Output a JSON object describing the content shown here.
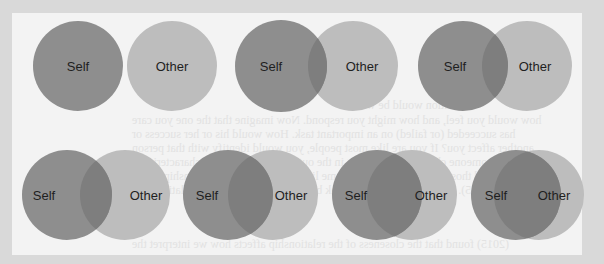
{
  "figure": {
    "type": "Inclusion of Other in the Self diagram",
    "labels": {
      "self": "Self",
      "other": "Other"
    },
    "colors": {
      "page_border": "#d9d9d9",
      "panel_background": "#f3f3f3",
      "self_fill": "#8e8e8e",
      "other_fill": "#bdbdbd",
      "overlap_fill": "#7e7e7e",
      "label_color": "#1f1f1f"
    },
    "pairs": [
      {
        "id": 1,
        "row": 1,
        "self": {
          "cx": 78,
          "cy": 66,
          "r": 45
        },
        "other": {
          "cx": 172,
          "cy": 66,
          "r": 45
        },
        "self_label": "Self",
        "other_label": "Other"
      },
      {
        "id": 2,
        "row": 1,
        "self": {
          "cx": 281,
          "cy": 66,
          "r": 46
        },
        "other": {
          "cx": 353,
          "cy": 66,
          "r": 45
        },
        "self_label": "Self",
        "other_label": "Other"
      },
      {
        "id": 3,
        "row": 1,
        "self": {
          "cx": 463,
          "cy": 66,
          "r": 45
        },
        "other": {
          "cx": 527,
          "cy": 66,
          "r": 45
        },
        "self_label": "Self",
        "other_label": "Other"
      },
      {
        "id": 4,
        "row": 2,
        "self": {
          "cx": 67,
          "cy": 195,
          "r": 45
        },
        "other": {
          "cx": 125,
          "cy": 195,
          "r": 45
        },
        "self_label": "Self",
        "other_label": "Other"
      },
      {
        "id": 5,
        "row": 2,
        "self": {
          "cx": 228,
          "cy": 195,
          "r": 45
        },
        "other": {
          "cx": 273,
          "cy": 195,
          "r": 45
        },
        "self_label": "Self",
        "other_label": "Other"
      },
      {
        "id": 6,
        "row": 2,
        "self": {
          "cx": 377,
          "cy": 195,
          "r": 45
        },
        "other": {
          "cx": 412,
          "cy": 195,
          "r": 45
        },
        "self_label": "Self",
        "other_label": "Other"
      },
      {
        "id": 7,
        "row": 2,
        "self": {
          "cx": 516,
          "cy": 195,
          "r": 45
        },
        "other": {
          "cx": 539,
          "cy": 195,
          "r": 45
        },
        "self_label": "Self",
        "other_label": "Other"
      }
    ],
    "label_positions": [
      {
        "self_x": 78,
        "other_x": 172
      },
      {
        "self_x": 271,
        "other_x": 362
      },
      {
        "self_x": 455,
        "other_x": 535
      },
      {
        "self_x": 44,
        "other_x": 146
      },
      {
        "self_x": 207,
        "other_x": 291
      },
      {
        "self_x": 356,
        "other_x": 431
      },
      {
        "self_x": 496,
        "other_x": 554
      }
    ]
  },
  "bleed_through": {
    "title_fragment": "W",
    "lines": [
      "cation would be what",
      "how would you feel, and how might you respond. Now imagine that the one you care",
      "has succeeded (or failed) on an important task. How would his or her success or",
      "another affect you? If you are like most people, you would identify with that person",
      "as someone close to you, sharing in the outcome, because your characteristics",
      "and those of the other have become linked through your relationship (Aron",
      "& Aron, 2015). Indeed research on the link between the self and close relationships",
      "(2015) found that the closeness of the relationship affects how we interpret the",
      "and important information about goals and aspirations, and it is the only factor that"
    ]
  }
}
